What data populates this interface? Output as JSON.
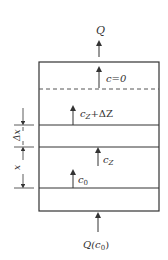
{
  "diagram": {
    "type": "column-concentration-profile",
    "labels": {
      "outlet": "Q",
      "c_zero": "c=0",
      "c_z_plus": "c",
      "c_z_plus_sub": "Z",
      "c_z_plus_suffix": "+ΔZ",
      "c_z": "c",
      "c_z_sub": "Z",
      "c_0": "c",
      "c_0_sub": "0",
      "inlet_prefix": "Q(c",
      "inlet_sub": "0",
      "inlet_suffix": ")",
      "delta_x": "Δx",
      "x": "x"
    },
    "colors": {
      "line": "#333333",
      "background": "#ffffff"
    }
  }
}
